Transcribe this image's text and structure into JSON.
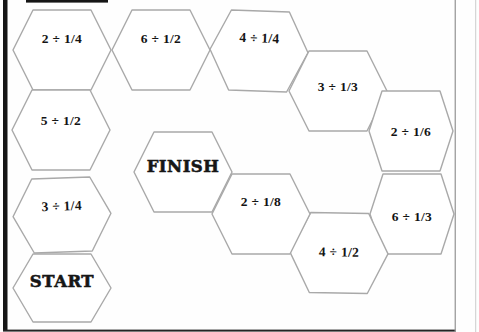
{
  "board": {
    "stroke_color": "#a9a9a9",
    "text_color": "#141414",
    "cells": [
      {
        "name": "hex-cell-2-div-1-4",
        "label": "2 ÷ 1/4",
        "type": "problem",
        "cx": 62,
        "cy": 50,
        "w": 98,
        "h": 80,
        "tw": 58,
        "dy": -12,
        "rot": 0
      },
      {
        "name": "hex-cell-6-div-1-2",
        "label": "6 ÷ 1/2",
        "type": "problem",
        "cx": 161,
        "cy": 50,
        "w": 98,
        "h": 80,
        "tw": 58,
        "dy": -12,
        "rot": 0
      },
      {
        "name": "hex-cell-4-div-1-4",
        "label": "4 ÷ 1/4",
        "type": "problem",
        "cx": 259,
        "cy": 51,
        "w": 98,
        "h": 80,
        "tw": 58,
        "dy": -13,
        "rot": 2
      },
      {
        "name": "hex-cell-3-div-1-3",
        "label": "3 ÷ 1/3",
        "type": "problem",
        "cx": 338,
        "cy": 91,
        "w": 98,
        "h": 80,
        "tw": 58,
        "dy": -5,
        "rot": 0
      },
      {
        "name": "hex-cell-2-div-1-6",
        "label": "2 ÷ 1/6",
        "type": "problem",
        "cx": 411,
        "cy": 131,
        "w": 84,
        "h": 80,
        "tw": 58,
        "dy": 0,
        "rot": 0
      },
      {
        "name": "hex-cell-6-div-1-3",
        "label": "6 ÷ 1/3",
        "type": "problem",
        "cx": 412,
        "cy": 214,
        "w": 84,
        "h": 80,
        "tw": 58,
        "dy": 2,
        "rot": 0
      },
      {
        "name": "hex-cell-4-div-1-2",
        "label": "4 ÷ 1/2",
        "type": "problem",
        "cx": 339,
        "cy": 253,
        "w": 98,
        "h": 80,
        "tw": 58,
        "dy": -1,
        "rot": 1
      },
      {
        "name": "hex-cell-2-div-1-8",
        "label": "2 ÷ 1/8",
        "type": "problem",
        "cx": 261,
        "cy": 214,
        "w": 98,
        "h": 80,
        "tw": 58,
        "dy": -13,
        "rot": 0
      },
      {
        "name": "hex-cell-finish",
        "label": "FINISH",
        "type": "finish",
        "cx": 183,
        "cy": 172,
        "w": 98,
        "h": 80,
        "tw": 58,
        "dy": -6,
        "rot": 0
      },
      {
        "name": "hex-cell-5-div-1-2",
        "label": "5 ÷ 1/2",
        "type": "problem",
        "cx": 61,
        "cy": 130,
        "w": 98,
        "h": 80,
        "tw": 58,
        "dy": -10,
        "rot": 0
      },
      {
        "name": "hex-cell-3-div-1-4",
        "label": "3 ÷ 1/4",
        "type": "problem",
        "cx": 62,
        "cy": 215,
        "w": 98,
        "h": 74,
        "tw": 58,
        "dy": -9,
        "rot": -2
      },
      {
        "name": "hex-cell-start",
        "label": "START",
        "type": "start",
        "cx": 62,
        "cy": 288,
        "w": 98,
        "h": 68,
        "tw": 58,
        "dy": -7,
        "rot": 0
      }
    ]
  }
}
